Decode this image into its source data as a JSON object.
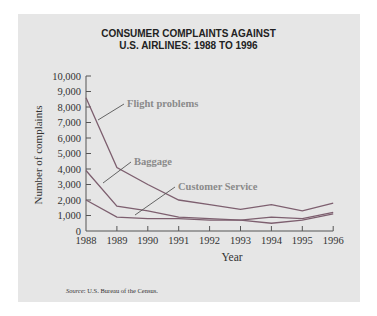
{
  "chart_data": {
    "type": "line",
    "title": "CONSUMER COMPLAINTS AGAINST U.S. AIRLINES: 1988 TO 1996",
    "title_lines": [
      "CONSUMER COMPLAINTS AGAINST",
      "U.S. AIRLINES: 1988 TO 1996"
    ],
    "xlabel": "Year",
    "ylabel": "Number of complaints",
    "x": [
      1988,
      1989,
      1990,
      1991,
      1992,
      1993,
      1994,
      1995,
      1996
    ],
    "ylim": [
      0,
      10000
    ],
    "yticks": [
      "0",
      "1,000",
      "2,000",
      "3,000",
      "4,000",
      "5,000",
      "6,000",
      "7,000",
      "8,000",
      "9,000",
      "10,000"
    ],
    "grid": false,
    "series": [
      {
        "name": "Flight problems",
        "values": [
          8600,
          4100,
          3000,
          2000,
          1700,
          1400,
          1700,
          1300,
          1800
        ]
      },
      {
        "name": "Baggage",
        "values": [
          3900,
          1600,
          1300,
          900,
          800,
          700,
          900,
          800,
          1200
        ]
      },
      {
        "name": "Customer Service",
        "values": [
          2000,
          900,
          800,
          800,
          700,
          700,
          500,
          700,
          1100
        ]
      }
    ],
    "annotations": [
      "Flight problems",
      "Baggage",
      "Customer Service"
    ],
    "source": "Source: U.S. Bureau of the Census."
  },
  "source_label": "Source",
  "source_text": ": U.S. Bureau of the Census.",
  "colors": {
    "line": "#7d5f6f",
    "label": "#8a8a8a",
    "background": "#e6e6e6"
  }
}
